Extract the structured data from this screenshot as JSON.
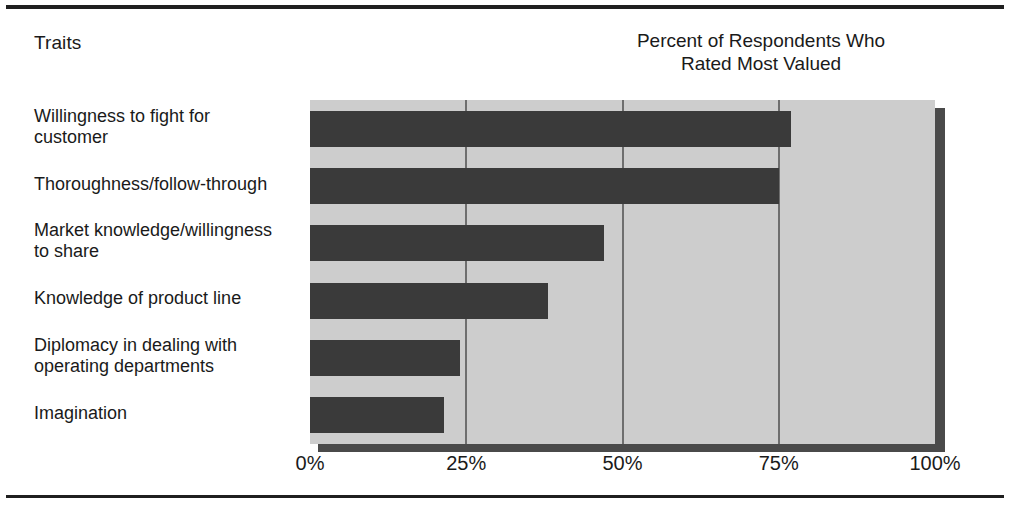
{
  "figure": {
    "y_axis_title": "Traits",
    "chart_title_line1": "Percent of Respondents Who",
    "chart_title_line2": "Rated Most Valued"
  },
  "colors": {
    "bar": "#3a3a3a",
    "plot_background": "#cdcdcd",
    "gridline": "#6e6e6e",
    "shadow": "#4a4a4a",
    "frame_rule": "#1f1f1f",
    "text": "#1a1a1a"
  },
  "chart_data": {
    "type": "bar",
    "orientation": "horizontal",
    "title": "Percent of Respondents Who Rated Most Valued",
    "xlabel": "Percent of Respondents Who Rated Most Valued",
    "ylabel": "Traits",
    "categories": [
      "Willingness to fight for customer",
      "Thoroughness/follow-through",
      "Market knowledge/willingness to share",
      "Knowledge of product line",
      "Diplomacy in dealing with operating departments",
      "Imagination"
    ],
    "category_lines": [
      [
        "Willingness to fight for",
        "customer"
      ],
      [
        "Thoroughness/follow-through"
      ],
      [
        "Market knowledge/willingness",
        "to share"
      ],
      [
        "Knowledge of product line"
      ],
      [
        "Diplomacy in dealing with",
        "operating departments"
      ],
      [
        "Imagination"
      ]
    ],
    "values": [
      77,
      75,
      47,
      38,
      24,
      21.5
    ],
    "value_labels": [
      "77%",
      "75%",
      "47%",
      "38%",
      "24%",
      "22%"
    ],
    "xlim": [
      0,
      100
    ],
    "xticks": [
      0,
      25,
      50,
      75,
      100
    ],
    "xtick_labels": [
      "0%",
      "25%",
      "50%",
      "75%",
      "100%"
    ],
    "grid": true,
    "grid_axis": "x",
    "legend": false
  }
}
